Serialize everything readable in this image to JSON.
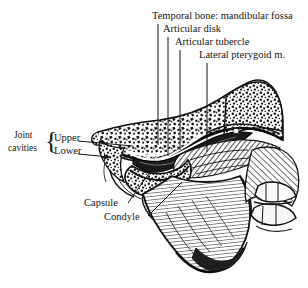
{
  "figure": {
    "style": "black-and-white anatomical engraving",
    "background_color": "#ffffff",
    "ink_color": "#141414"
  },
  "labels": {
    "temporal_bone": "Temporal bone: mandibular fossa",
    "articular_disk": "Articular disk",
    "articular_tubercle": "Articular tubercle",
    "lateral_pterygoid": "Lateral pterygoid m.",
    "joint": "Joint",
    "cavities": "cavities",
    "upper": "Upper",
    "lower": "Lower",
    "capsule": "Capsule",
    "condyle": "Condyle",
    "brace_glyph": "{"
  }
}
